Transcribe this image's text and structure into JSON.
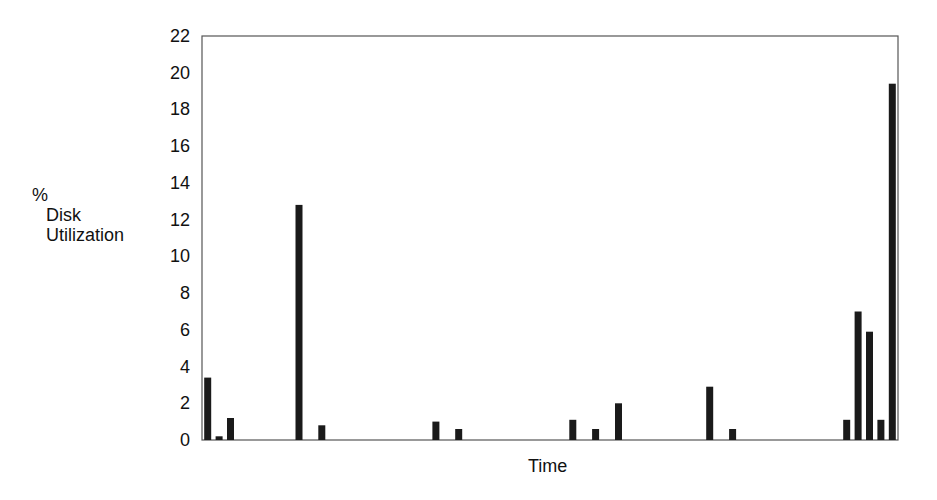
{
  "chart_data": {
    "type": "bar",
    "title": "",
    "xlabel": "Time",
    "ylabel_lines": [
      "%",
      "Disk",
      "Utilization"
    ],
    "ylabel": "% Disk Utilization",
    "ylim": [
      0,
      22
    ],
    "yticks": [
      0,
      2,
      4,
      6,
      8,
      10,
      12,
      14,
      16,
      18,
      20,
      22
    ],
    "grid": false,
    "legend": null,
    "num_slots": 61,
    "x": [
      0,
      1,
      2,
      8,
      10,
      20,
      22,
      32,
      34,
      36,
      44,
      46,
      56,
      57,
      58,
      59,
      60
    ],
    "values": [
      3.4,
      0.2,
      1.2,
      12.8,
      0.8,
      1.0,
      0.6,
      1.1,
      0.6,
      2.0,
      2.9,
      0.6,
      1.1,
      7.0,
      5.9,
      1.1,
      19.4
    ],
    "bar_color": "#1a1a1a",
    "axis_color": "#555555"
  }
}
